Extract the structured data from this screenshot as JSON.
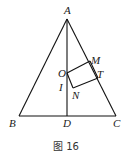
{
  "figure": {
    "caption": "图 16",
    "points": {
      "A": {
        "label": "A",
        "x": 67,
        "y": 19
      },
      "B": {
        "label": "B",
        "x": 19,
        "y": 116
      },
      "C": {
        "label": "C",
        "x": 116,
        "y": 116
      },
      "D": {
        "label": "D",
        "x": 67,
        "y": 116
      },
      "O": {
        "label": "O",
        "x": 67,
        "y": 73
      },
      "M": {
        "label": "M",
        "x": 90,
        "y": 61
      },
      "T": {
        "label": "T",
        "x": 98,
        "y": 78
      },
      "N": {
        "label": "N",
        "x": 73,
        "y": 88
      },
      "I": {
        "label": "I",
        "x": 67,
        "y": 85
      }
    },
    "segments": [
      "AB",
      "AC",
      "BC",
      "AD",
      "OM",
      "MT",
      "TN",
      "NO"
    ]
  }
}
